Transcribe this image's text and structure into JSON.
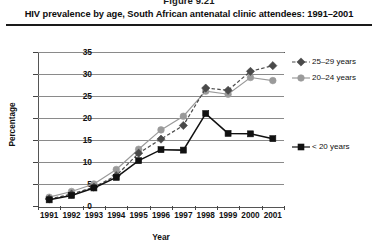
{
  "figure": {
    "number": "Figure 9.21",
    "title": "HIV prevalence by age, South African antenatal clinic attendees: 1991–2001"
  },
  "legend": {
    "items": [
      {
        "label": "25–29 years",
        "marker": "diamond-marker-icon",
        "color": "#4a4a4a",
        "style": "dashed"
      },
      {
        "label": "20–24 years",
        "marker": "circle-marker-icon",
        "color": "#9a9a9a",
        "style": "solid"
      },
      {
        "label": "< 20 years",
        "marker": "square-marker-icon",
        "color": "#111111",
        "style": "solid"
      }
    ]
  },
  "chart_data": {
    "type": "line",
    "title": "HIV prevalence by age, South African antenatal clinic attendees: 1991–2001",
    "xlabel": "Year",
    "ylabel": "Percentage",
    "x": [
      "1991",
      "1992",
      "1993",
      "1994",
      "1995",
      "1996",
      "1997",
      "1998",
      "1999",
      "2000",
      "2001"
    ],
    "categories": [
      "1991",
      "1992",
      "1993",
      "1994",
      "1995",
      "1996",
      "1997",
      "1998",
      "1999",
      "2000",
      "2001"
    ],
    "ylim": [
      0,
      35
    ],
    "yticks": [
      0,
      5,
      10,
      15,
      20,
      25,
      30,
      35
    ],
    "grid": true,
    "legend_position": "right",
    "series": [
      {
        "name": "25–29 years",
        "color": "#4a4a4a",
        "marker": "diamond",
        "linestyle": "dashed",
        "values": [
          1.6,
          2.7,
          4.3,
          6.9,
          12.0,
          15.2,
          18.3,
          26.8,
          26.3,
          30.6,
          31.9
        ]
      },
      {
        "name": "20–24 years",
        "color": "#9a9a9a",
        "marker": "circle",
        "linestyle": "solid",
        "values": [
          2.0,
          3.3,
          5.0,
          8.3,
          12.9,
          17.3,
          20.4,
          26.1,
          25.4,
          29.2,
          28.5
        ]
      },
      {
        "name": "< 20 years",
        "color": "#111111",
        "marker": "square",
        "linestyle": "solid",
        "values": [
          1.4,
          2.4,
          4.1,
          6.5,
          10.3,
          12.8,
          12.7,
          21.0,
          16.5,
          16.4,
          15.3
        ]
      }
    ]
  },
  "axes": {
    "ytick_labels": [
      "35",
      "30",
      "25",
      "20",
      "15",
      "10",
      "5",
      "0"
    ],
    "xtick_labels": [
      "1991",
      "1992",
      "1993",
      "1994",
      "1995",
      "1996",
      "1997",
      "1998",
      "1999",
      "2000",
      "2001"
    ]
  }
}
